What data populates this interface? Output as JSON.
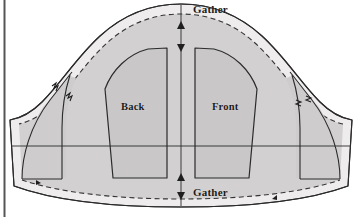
{
  "diagram": {
    "type": "sewing-pattern",
    "background_color": "#ffffff",
    "fill_light": "#eceaea",
    "fill_mid": "#d6d4d4",
    "fill_dark": "#c9c7c7",
    "line_color": "#2b2b2b",
    "dash_color": "#3a3a3a",
    "labels": {
      "gather_top": "Gather",
      "gather_bottom": "Gather",
      "back": "Back",
      "front": "Front"
    },
    "markers": {
      "center_line": "vertical-center-grainline",
      "horizontal_line": "horizontal-guideline",
      "notch_left": "notch-marks-left",
      "notch_right": "notch-marks-right",
      "arrow_top_up": "arrow-up",
      "arrow_top_down": "arrow-down",
      "arrow_bottom_up": "arrow-up",
      "arrow_bottom_down": "arrow-down"
    },
    "edges": {
      "outer": "solid-cut-line",
      "inner": "dashed-stitch-line"
    },
    "left_rule": "page-margin-rule"
  }
}
